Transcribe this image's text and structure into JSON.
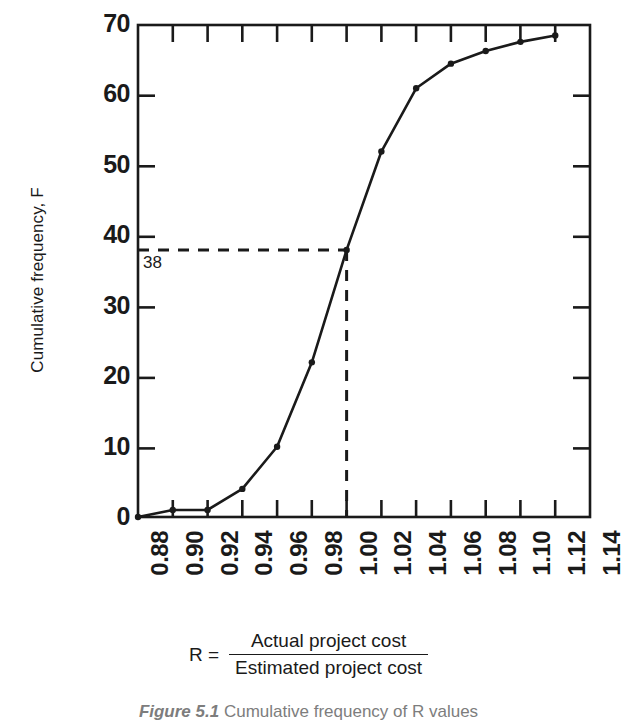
{
  "chart_data": {
    "type": "line",
    "title": "",
    "xlabel": "R",
    "ylabel": "Cumulative frequency, F",
    "x": [
      0.88,
      0.9,
      0.92,
      0.94,
      0.96,
      0.98,
      1.0,
      1.02,
      1.04,
      1.06,
      1.08,
      1.1,
      1.12
    ],
    "values": [
      0,
      1,
      1,
      4,
      10,
      22,
      38,
      52,
      61,
      64.5,
      66.3,
      67.6,
      68.5
    ],
    "series": [
      {
        "name": "Cumulative frequency",
        "values": [
          0,
          1,
          1,
          4,
          10,
          22,
          38,
          52,
          61,
          64.5,
          66.3,
          67.6,
          68.5
        ]
      }
    ],
    "xlim": [
      0.88,
      1.14
    ],
    "ylim": [
      0,
      70
    ],
    "xticks": [
      "0.88",
      "0.90",
      "0.92",
      "0.94",
      "0.96",
      "0.98",
      "1.00",
      "1.02",
      "1.04",
      "1.06",
      "1.08",
      "1.10",
      "1.12",
      "1.14"
    ],
    "xtick_values": [
      0.88,
      0.9,
      0.92,
      0.94,
      0.96,
      0.98,
      1.0,
      1.02,
      1.04,
      1.06,
      1.08,
      1.1,
      1.12,
      1.14
    ],
    "yticks": [
      "0",
      "10",
      "20",
      "30",
      "40",
      "50",
      "60",
      "70"
    ],
    "ytick_values": [
      0,
      10,
      20,
      30,
      40,
      50,
      60,
      70
    ],
    "grid": false,
    "legend": "none",
    "markers": true,
    "line_color": "#1a1a1a",
    "annotations": [
      {
        "label": "38",
        "y": 38,
        "x": 1.0,
        "style": "dashed-guide-lines"
      }
    ]
  },
  "axes": {
    "y_title": "Cumulative frequency, F",
    "y_tick_labels": [
      "70",
      "60",
      "50",
      "40",
      "30",
      "20",
      "10",
      "0"
    ],
    "x_tick_labels": [
      "0.88",
      "0.90",
      "0.92",
      "0.94",
      "0.96",
      "0.98",
      "1.00",
      "1.02",
      "1.04",
      "1.06",
      "1.08",
      "1.10",
      "1.12",
      "1.14"
    ]
  },
  "annotation": {
    "value_38": "38"
  },
  "formula": {
    "lhs": "R =",
    "numerator": "Actual project cost",
    "denominator": "Estimated project cost"
  },
  "caption": {
    "label": "Figure 5.1",
    "text": "Cumulative frequency of R values"
  },
  "colors": {
    "ink": "#1a1a1a",
    "caption": "#7d7d7d",
    "background": "#ffffff"
  }
}
